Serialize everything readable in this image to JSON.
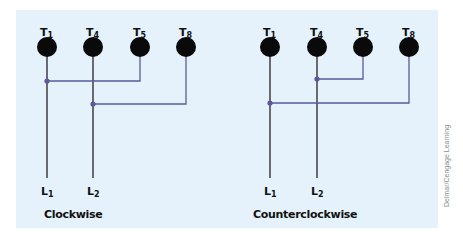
{
  "colors": {
    "background": "#e6f2fb",
    "terminal": "#0a0a0a",
    "lead_line": "#222222",
    "jumper": "#5a5a9a"
  },
  "diagrams": [
    {
      "caption": "Clockwise",
      "terminals": [
        {
          "label": "T",
          "sub": "1"
        },
        {
          "label": "T",
          "sub": "4"
        },
        {
          "label": "T",
          "sub": "5"
        },
        {
          "label": "T",
          "sub": "8"
        }
      ],
      "leads": [
        {
          "label": "L",
          "sub": "1"
        },
        {
          "label": "L",
          "sub": "2"
        }
      ],
      "connections": [
        "T1-T5 to L1",
        "T4-T8 to L2"
      ]
    },
    {
      "caption": "Counterclockwise",
      "terminals": [
        {
          "label": "T",
          "sub": "1"
        },
        {
          "label": "T",
          "sub": "4"
        },
        {
          "label": "T",
          "sub": "5"
        },
        {
          "label": "T",
          "sub": "8"
        }
      ],
      "leads": [
        {
          "label": "L",
          "sub": "1"
        },
        {
          "label": "L",
          "sub": "2"
        }
      ],
      "connections": [
        "T1-T8 to L1",
        "T4-T5 to L2"
      ]
    }
  ],
  "credit": "Delmar/Cengage Learning"
}
